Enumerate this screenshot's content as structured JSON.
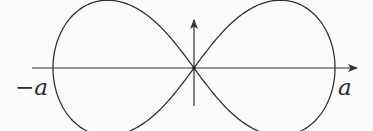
{
  "diagram": {
    "type": "lemniscate-of-bernoulli",
    "labels": {
      "left_intercept": "−a",
      "right_intercept": "a"
    },
    "axes": {
      "x_axis": {
        "arrow": "right"
      },
      "y_axis": {
        "arrow": "up"
      }
    },
    "colors": {
      "stroke": "#333333",
      "background": "#fbfbf9"
    }
  }
}
